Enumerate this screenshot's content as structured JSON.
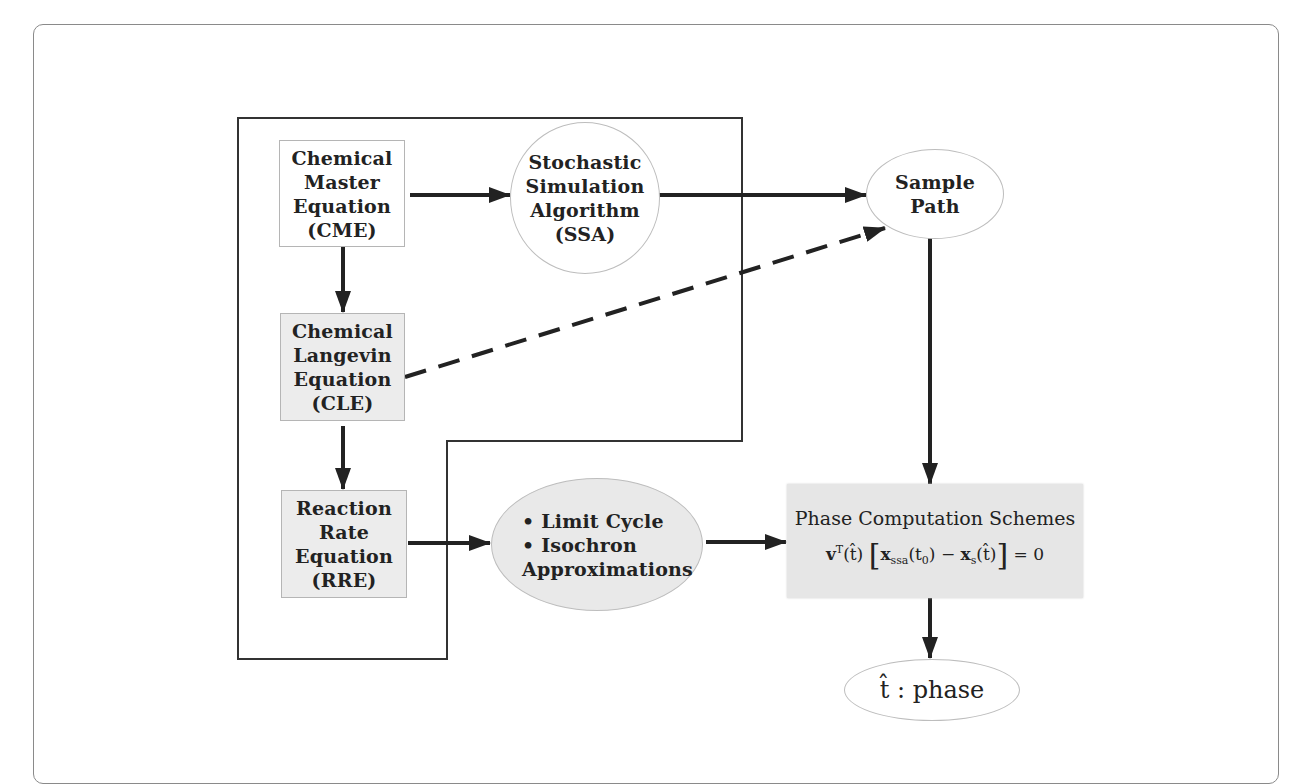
{
  "diagram": {
    "nodes": {
      "cme": {
        "lines": [
          "Chemical",
          "Master",
          "Equation",
          "(CME)"
        ],
        "shape": "rectangle",
        "fill": "#ffffff"
      },
      "cle": {
        "lines": [
          "Chemical",
          "Langevin",
          "Equation",
          "(CLE)"
        ],
        "shape": "rectangle",
        "fill": "#ececec"
      },
      "rre": {
        "lines": [
          "Reaction",
          "Rate",
          "Equation",
          "(RRE)"
        ],
        "shape": "rectangle",
        "fill": "#ececec"
      },
      "ssa": {
        "lines": [
          "Stochastic",
          "Simulation",
          "Algorithm",
          "(SSA)"
        ],
        "shape": "circle",
        "fill": "#ffffff"
      },
      "sample_path": {
        "lines": [
          "Sample",
          "Path"
        ],
        "shape": "ellipse",
        "fill": "#ffffff"
      },
      "limit_cycle": {
        "lines": [
          "• Limit Cycle",
          "• Isochron",
          "Approximations"
        ],
        "shape": "ellipse",
        "fill": "#e9e9e9"
      },
      "phase": {
        "title": "Phase Computation Schemes",
        "equation": {
          "v": "v",
          "v_sup": "T",
          "t_hat": "(t̂)",
          "x_ssa": "x",
          "x_ssa_sub": "ssa",
          "t0": "(t",
          "t0_sub": "0",
          "t0_close": ")",
          "minus": " − ",
          "x_s": "x",
          "x_s_sub": "s",
          "t_hat2": "(t̂)",
          "lbracket": "[",
          "rbracket": "]",
          "rhs": " = 0"
        },
        "shape": "rectangle",
        "fill": "#e6e6e6"
      },
      "output": {
        "symbol": "t̂",
        "separator": " : ",
        "label": "phase",
        "shape": "ellipse",
        "fill": "#ffffff"
      }
    },
    "edges": [
      {
        "from": "cme",
        "to": "ssa",
        "style": "solid"
      },
      {
        "from": "cme",
        "to": "cle",
        "style": "solid"
      },
      {
        "from": "cle",
        "to": "rre",
        "style": "solid"
      },
      {
        "from": "ssa",
        "to": "sample_path",
        "style": "solid"
      },
      {
        "from": "cle",
        "to": "sample_path",
        "style": "dashed"
      },
      {
        "from": "rre",
        "to": "limit_cycle",
        "style": "solid"
      },
      {
        "from": "limit_cycle",
        "to": "phase",
        "style": "solid"
      },
      {
        "from": "sample_path",
        "to": "phase",
        "style": "solid"
      },
      {
        "from": "phase",
        "to": "output",
        "style": "solid"
      }
    ],
    "grouping": {
      "shape": "L-shaped outline",
      "contains": [
        "cme",
        "cle",
        "rre",
        "ssa"
      ]
    },
    "colors": {
      "stroke": "#222222",
      "box_border": "#b5b5b5",
      "gray_fill": "#ececec",
      "card_border": "#8a8a8a"
    }
  }
}
